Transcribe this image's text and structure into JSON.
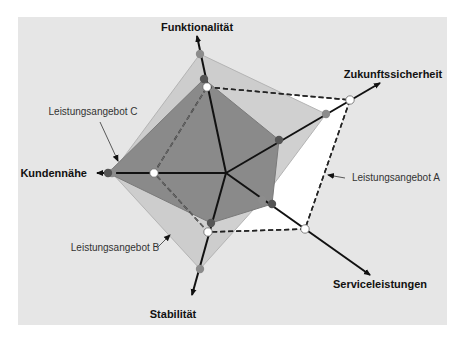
{
  "chart_data": {
    "type": "radar",
    "title": "",
    "center": [
      226,
      173
    ],
    "background_panel": {
      "x": 18,
      "y": 17,
      "width": 429,
      "height": 308,
      "color": "#e6e6e6"
    },
    "axes": [
      {
        "name": "Funktionalität",
        "tip": [
          197,
          36
        ],
        "label_pos": [
          197,
          31
        ],
        "anchor": "middle"
      },
      {
        "name": "Zukunftssicherheit",
        "tip": [
          380,
          83
        ],
        "label_pos": [
          393,
          78
        ],
        "anchor": "middle"
      },
      {
        "name": "Serviceleistungen",
        "tip": [
          370,
          275
        ],
        "label_pos": [
          380,
          288
        ],
        "anchor": "middle"
      },
      {
        "name": "Stabilität",
        "tip": [
          192,
          295
        ],
        "label_pos": [
          173,
          318
        ],
        "anchor": "middle"
      },
      {
        "name": "Kundennähe",
        "tip": [
          97,
          173
        ],
        "label_pos": [
          87,
          177
        ],
        "anchor": "end"
      }
    ],
    "series": [
      {
        "name": "Leistungsangebot B",
        "style": "filled-light",
        "fill": "#c8c8c8",
        "stroke": "#b4b4b4",
        "marker": "#8c8c8c",
        "points": [
          [
            200,
            54
          ],
          [
            326,
            114
          ],
          [
            262,
            200
          ],
          [
            200,
            269
          ],
          [
            112,
            173
          ]
        ],
        "values": [
          0.86,
          0.64,
          0.32,
          0.69,
          0.78
        ]
      },
      {
        "name": "Leistungsangebot C",
        "style": "filled-dark",
        "fill": "#8a8a8a",
        "stroke": "#7a7a7a",
        "marker": "#555555",
        "points": [
          [
            204,
            79
          ],
          [
            279,
            140
          ],
          [
            272,
            204
          ],
          [
            211,
            223
          ],
          [
            108,
            173
          ]
        ],
        "values": [
          0.69,
          0.4,
          0.37,
          0.42,
          0.92
        ]
      },
      {
        "name": "Leistungsangebot A",
        "style": "dashed-white",
        "fill": "#ffffff",
        "stroke": "#222222",
        "marker": "#ffffff",
        "points": [
          [
            207,
            87
          ],
          [
            350,
            100
          ],
          [
            305,
            229
          ],
          [
            208,
            232
          ],
          [
            154,
            173
          ]
        ],
        "values": [
          0.64,
          0.93,
          0.56,
          0.51,
          0.56
        ]
      }
    ],
    "callouts": [
      {
        "text": "Leistungsangebot C",
        "text_pos": [
          93,
          115
        ],
        "line": [
          [
            100,
            122
          ],
          [
            118,
            161
          ]
        ]
      },
      {
        "text": "Leistungsangebot A",
        "text_pos": [
          352,
          181
        ],
        "line": [
          [
            345,
            178
          ],
          [
            328,
            175
          ]
        ]
      },
      {
        "text": "Leistungsangebot B",
        "text_pos": [
          115,
          251
        ],
        "line": [
          [
            158,
            247
          ],
          [
            170,
            235
          ]
        ]
      }
    ],
    "legend": "none (callout labels)"
  }
}
